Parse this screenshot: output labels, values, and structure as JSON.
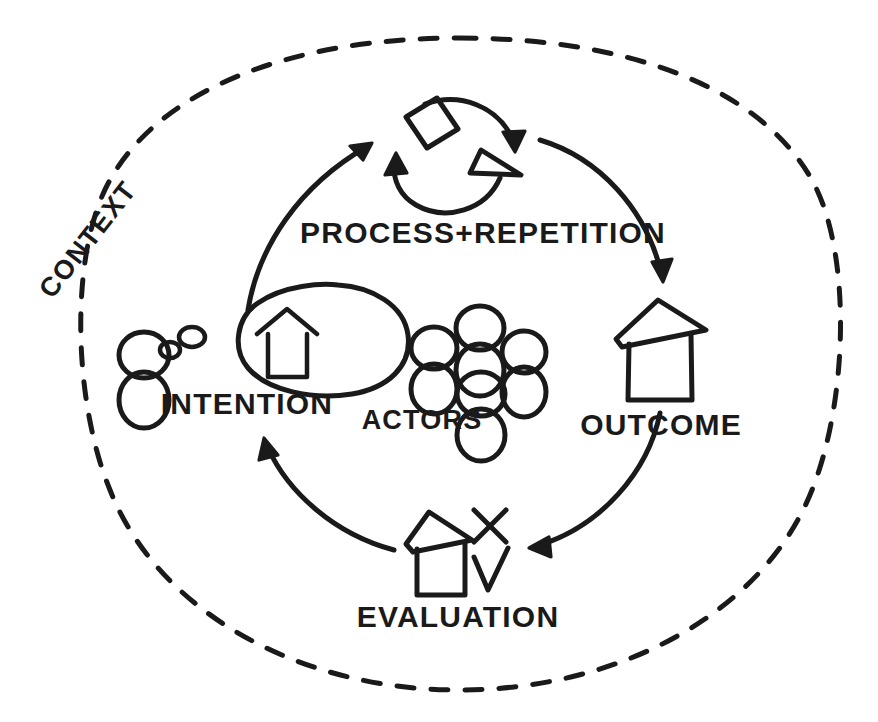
{
  "diagram": {
    "style": "hand-drawn sketch",
    "ink_color": "#1a1a1a",
    "background_color": "#ffffff",
    "boundary": {
      "label": "CONTEXT",
      "shape": "dashed-ellipse",
      "label_rotation_deg": -52
    },
    "center_group": {
      "label": "ACTORS",
      "icon": "people-group-icon",
      "figure_count": 4
    },
    "nodes": [
      {
        "id": "intention",
        "label": "INTENTION",
        "icon": "person-thought-bubble-house-icon",
        "position": "left"
      },
      {
        "id": "process",
        "label": "PROCESS+REPETITION",
        "icon": "circular-loop-square-triangle-icon",
        "position": "top"
      },
      {
        "id": "outcome",
        "label": "OUTCOME",
        "icon": "house-icon",
        "position": "right"
      },
      {
        "id": "evaluation",
        "label": "EVALUATION",
        "icon": "house-check-cross-icon",
        "position": "bottom"
      }
    ],
    "flow_arrows": [
      {
        "from": "intention",
        "to": "process",
        "direction": "clockwise"
      },
      {
        "from": "process",
        "to": "outcome",
        "direction": "clockwise"
      },
      {
        "from": "outcome",
        "to": "evaluation",
        "direction": "clockwise"
      },
      {
        "from": "evaluation",
        "to": "intention",
        "direction": "clockwise"
      }
    ]
  }
}
